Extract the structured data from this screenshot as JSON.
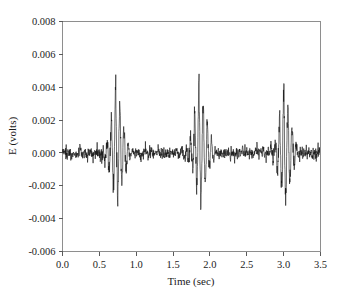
{
  "chart_data": {
    "type": "line",
    "title": "",
    "xlabel": "Time (sec)",
    "ylabel": "E (volts)",
    "xlim": [
      0.0,
      3.5
    ],
    "ylim": [
      -0.006,
      0.008
    ],
    "xticks": [
      "0.0",
      "0.5",
      "1.0",
      "1.5",
      "2.0",
      "2.5",
      "3.0",
      "3.5"
    ],
    "xtick_values": [
      0.0,
      0.5,
      1.0,
      1.5,
      2.0,
      2.5,
      3.0,
      3.5
    ],
    "yticks": [
      "0.008",
      "0.006",
      "0.004",
      "0.002",
      "0.000",
      "-0.002",
      "-0.004",
      "-0.006"
    ],
    "ytick_values": [
      0.008,
      0.006,
      0.004,
      0.002,
      0.0,
      -0.002,
      -0.004,
      -0.006
    ],
    "grid": false,
    "legend": false,
    "series_name": "E (volts)",
    "line_color": "#141414",
    "background_color": "#ffffff",
    "frame_color": "#8e8e8e",
    "baseline_noise_amplitude": 0.0007,
    "sample_interval_sec": 0.0025,
    "bursts": [
      {
        "center_sec": 0.72,
        "peak_volts": 0.0047,
        "trough_volts": -0.0035,
        "width_sec": 0.3
      },
      {
        "center_sec": 1.85,
        "peak_volts": 0.0051,
        "trough_volts": -0.0037,
        "width_sec": 0.3
      },
      {
        "center_sec": 3.0,
        "peak_volts": 0.0047,
        "trough_volts": -0.0035,
        "width_sec": 0.3
      }
    ]
  }
}
